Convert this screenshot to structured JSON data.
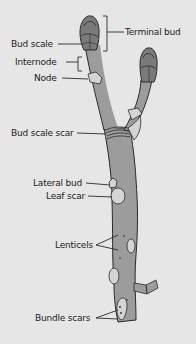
{
  "diagram": {
    "colors": {
      "background": "#e6e6e6",
      "stem": "#9c9c9c",
      "bud": "#7a7a7a",
      "scar": "#d4d4d4",
      "outline": "#2a2a2a",
      "text": "#1c1c1c"
    },
    "labels": {
      "terminal_bud": "Terminal bud",
      "bud_scale": "Bud scale",
      "internode": "Internode",
      "node": "Node",
      "bud_scale_scar": "Bud scale scar",
      "lateral_bud": "Lateral bud",
      "leaf_scar": "Leaf scar",
      "lenticels": "Lenticels",
      "bundle_scars": "Bundle scars"
    }
  }
}
